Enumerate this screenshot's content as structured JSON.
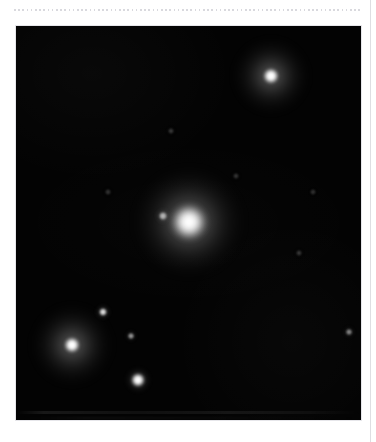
{
  "page": {
    "background_color": "#ffffff",
    "top_rule": {
      "name": "dotted-rule",
      "color": "#d9d9de",
      "x": 14,
      "y": 9,
      "width": 348
    },
    "right_margin_rule": {
      "color": "#dedee2",
      "x": 370
    }
  },
  "panel": {
    "label": "astronomical-image",
    "x": 16,
    "y": 26,
    "width": 345,
    "height": 394,
    "background_color": "#030303",
    "border_color": "#e6e6ea"
  },
  "sources": [
    {
      "id": "primary-star",
      "label": "central bright source",
      "cx": 189,
      "cy": 222,
      "core_radius": 17,
      "core_color": "#ffffff",
      "halo_radius": 54,
      "halo_color": "#c8c8c8",
      "brightness": "very bright"
    },
    {
      "id": "primary-companion",
      "label": "faint companion west of primary",
      "cx": 163,
      "cy": 216,
      "core_radius": 4,
      "core_color": "#b4b4b4",
      "halo_radius": 9,
      "halo_color": "#6e6e6e",
      "brightness": "faint"
    },
    {
      "id": "upper-right-star",
      "label": "upper-right star with halo",
      "cx": 271,
      "cy": 76,
      "core_radius": 8,
      "core_color": "#ffffff",
      "halo_radius": 38,
      "halo_color": "#9a9a9a",
      "brightness": "bright"
    },
    {
      "id": "lower-left-star",
      "label": "lower-left star with ring halo",
      "cx": 72,
      "cy": 345,
      "core_radius": 8,
      "core_color": "#ffffff",
      "halo_radius": 40,
      "halo_color": "#a0a0a0",
      "brightness": "bright"
    },
    {
      "id": "lower-center-star",
      "label": "lower-center star",
      "cx": 138,
      "cy": 380,
      "core_radius": 7,
      "core_color": "#ffffff",
      "halo_radius": 14,
      "halo_color": "#8c8c8c",
      "brightness": "moderate"
    },
    {
      "id": "dot-a",
      "label": "small source above lower-left star",
      "cx": 103,
      "cy": 312,
      "core_radius": 4,
      "core_color": "#e0e0e0",
      "halo_radius": 9,
      "halo_color": "#707070",
      "brightness": "moderate-faint"
    },
    {
      "id": "dot-b",
      "label": "small source right of lower-left star",
      "cx": 131,
      "cy": 336,
      "core_radius": 3,
      "core_color": "#9a9a9a",
      "halo_radius": 7,
      "halo_color": "#4a4a4a",
      "brightness": "faint"
    },
    {
      "id": "dot-c",
      "label": "faint source at right edge",
      "cx": 349,
      "cy": 332,
      "core_radius": 3,
      "core_color": "#868686",
      "halo_radius": 7,
      "halo_color": "#3c3c3c",
      "brightness": "faint"
    },
    {
      "id": "dot-d",
      "label": "very faint speck upper-middle",
      "cx": 171,
      "cy": 131,
      "core_radius": 2,
      "core_color": "#2e2e2e",
      "halo_radius": 5,
      "halo_color": "#1a1a1a",
      "brightness": "very faint"
    },
    {
      "id": "dot-e",
      "label": "very faint speck mid-right",
      "cx": 299,
      "cy": 253,
      "core_radius": 2,
      "core_color": "#2a2a2a",
      "halo_radius": 5,
      "halo_color": "#181818",
      "brightness": "very faint"
    },
    {
      "id": "dot-f",
      "label": "very faint speck upper-right of center",
      "cx": 236,
      "cy": 176,
      "core_radius": 2,
      "core_color": "#242424",
      "halo_radius": 5,
      "halo_color": "#151515",
      "brightness": "very faint"
    },
    {
      "id": "dot-g",
      "label": "very faint speck left of center",
      "cx": 108,
      "cy": 192,
      "core_radius": 2,
      "core_color": "#202020",
      "halo_radius": 5,
      "halo_color": "#131313",
      "brightness": "very faint"
    },
    {
      "id": "dot-h",
      "label": "very faint speck mid-right low",
      "cx": 313,
      "cy": 192,
      "core_radius": 2,
      "core_color": "#1e1e1e",
      "halo_radius": 4,
      "halo_color": "#121212",
      "brightness": "very faint"
    }
  ]
}
